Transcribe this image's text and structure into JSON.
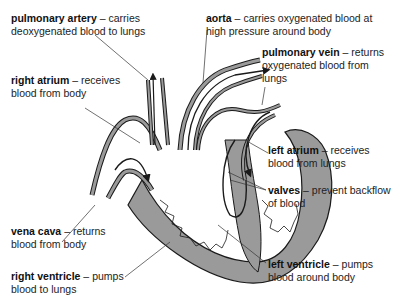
{
  "diagram": {
    "colors": {
      "muscle_fill": "#9a9a9a",
      "outline": "#1a1a1a",
      "leader_line": "#333333",
      "background": "#ffffff"
    },
    "labels": [
      {
        "id": "pulmonary-artery",
        "term": "pulmonary artery",
        "sep": " – ",
        "desc1": "carries",
        "desc2": "deoxygenated blood to lungs"
      },
      {
        "id": "aorta",
        "term": "aorta",
        "sep": " – ",
        "desc1": "carries oxygenated blood at",
        "desc2": "high pressure around body"
      },
      {
        "id": "pulmonary-vein",
        "term": "pulmonary vein",
        "sep": " – ",
        "desc1": "returns",
        "desc2": "oxygenated blood from",
        "desc3": "lungs"
      },
      {
        "id": "right-atrium",
        "term": "right atrium",
        "sep": " – ",
        "desc1": "receives",
        "desc2": "blood from body"
      },
      {
        "id": "left-atrium",
        "term": "left atrium",
        "sep": " – ",
        "desc1": "receives",
        "desc2": "blood from lungs"
      },
      {
        "id": "valves",
        "term": "valves",
        "sep": " – ",
        "desc1": "prevent backflow",
        "desc2": "of blood"
      },
      {
        "id": "vena-cava",
        "term": "vena cava",
        "sep": " – ",
        "desc1": "returns",
        "desc2": "blood from body"
      },
      {
        "id": "right-ventricle",
        "term": "right ventricle",
        "sep": " – ",
        "desc1": "pumps",
        "desc2": "blood to lungs"
      },
      {
        "id": "left-ventricle",
        "term": "left ventricle",
        "sep": " – ",
        "desc1": "pumps",
        "desc2": "blood around body"
      }
    ]
  }
}
